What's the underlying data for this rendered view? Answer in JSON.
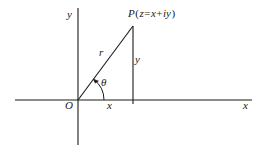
{
  "figure": {
    "type": "complex-plane-argand-diagram",
    "background_color": "#ffffff",
    "line_color": "#1a1a1a",
    "axes": {
      "x_axis_label": "x",
      "y_axis_label": "y",
      "origin_label": "O",
      "x_axis": {
        "x1": 15,
        "y1": 100,
        "x2": 252,
        "y2": 100
      },
      "y_axis": {
        "x1": 78,
        "y1": 8,
        "x2": 78,
        "y2": 145
      }
    },
    "point": {
      "label": "P",
      "expression_open": "(",
      "variable": "z",
      "equals": "=",
      "real_part": "x",
      "plus": "+",
      "imaginary_part": "iy",
      "expression_close": ")",
      "full_label": "P(z = x + iy)",
      "coords": {
        "x": 133,
        "y": 26
      }
    },
    "segments": {
      "radius_label": "r",
      "angle_label": "θ",
      "vertical_leg_label": "y",
      "horizontal_leg_label": "x"
    },
    "tick": {
      "x": 133,
      "y": 100
    }
  }
}
